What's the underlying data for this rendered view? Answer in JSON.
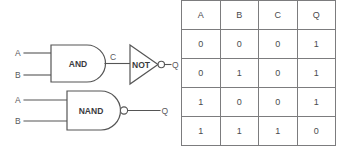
{
  "diagram": {
    "circuits": [
      {
        "id": "and-not-circuit",
        "gate": {
          "type": "AND",
          "label": "AND"
        },
        "inputs": [
          {
            "label": "A"
          },
          {
            "label": "B"
          }
        ],
        "intermediate": {
          "label": "C"
        },
        "inverter": {
          "type": "NOT",
          "label": "NOT",
          "has_bubble": true
        },
        "output": {
          "label": "Q"
        }
      },
      {
        "id": "nand-circuit",
        "gate": {
          "type": "NAND",
          "label": "NAND",
          "has_bubble": true
        },
        "inputs": [
          {
            "label": "A"
          },
          {
            "label": "B"
          }
        ],
        "output": {
          "label": "Q"
        }
      }
    ]
  },
  "truth_table": {
    "headers": [
      "A",
      "B",
      "C",
      "Q"
    ],
    "rows": [
      [
        "0",
        "0",
        "0",
        "1"
      ],
      [
        "0",
        "1",
        "0",
        "1"
      ],
      [
        "1",
        "0",
        "0",
        "1"
      ],
      [
        "1",
        "1",
        "1",
        "0"
      ]
    ]
  },
  "colors": {
    "stroke": "#555555",
    "text": "#4a4a4d",
    "table_border": "#7c7c7e",
    "background": "#ffffff"
  }
}
